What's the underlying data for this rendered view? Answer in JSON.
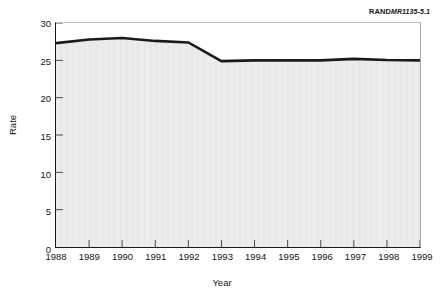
{
  "credit": {
    "brand": "RAND",
    "document": "MR1135-5.1"
  },
  "chart_data": {
    "type": "area",
    "title": "",
    "subtitle": "",
    "xlabel": "Year",
    "ylabel": "Rate",
    "categories": [
      "1988",
      "1989",
      "1990",
      "1991",
      "1992",
      "1993",
      "1994",
      "1995",
      "1996",
      "1997",
      "1998",
      "1999"
    ],
    "x": [
      1988,
      1989,
      1990,
      1991,
      1992,
      1993,
      1994,
      1995,
      1996,
      1997,
      1998,
      1999
    ],
    "values": [
      27.3,
      27.8,
      28.0,
      27.6,
      27.4,
      24.9,
      25.0,
      25.0,
      25.0,
      25.2,
      25.05,
      25.0
    ],
    "series": [
      {
        "name": "Rate",
        "values": [
          27.3,
          27.8,
          28.0,
          27.6,
          27.4,
          24.9,
          25.0,
          25.0,
          25.0,
          25.2,
          25.05,
          25.0
        ]
      }
    ],
    "xlim": [
      1988,
      1999
    ],
    "ylim": [
      0,
      30
    ],
    "ytick_values": [
      0,
      5,
      10,
      15,
      20,
      25,
      30
    ],
    "ytick_labels": [
      "0",
      "5",
      "10",
      "15",
      "20",
      "25",
      "30"
    ],
    "xtick_labels": [
      "1988",
      "1989",
      "1990",
      "1991",
      "1992",
      "1993",
      "1994",
      "1995",
      "1996",
      "1997",
      "1998",
      "1999"
    ],
    "grid": false,
    "legend": "none",
    "line_color": "#1a1a1a",
    "fill_color": "#ebebeb",
    "axis_color": "#1a1a1a",
    "tick_direction": "in"
  }
}
